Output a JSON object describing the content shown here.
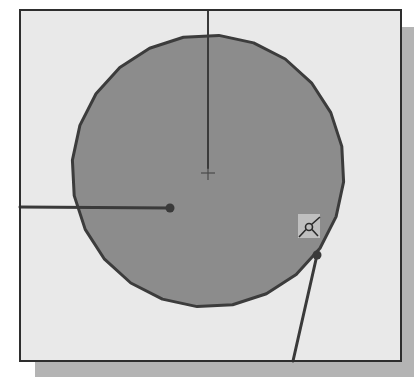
{
  "figure": {
    "colors": {
      "page_background": "#ffffff",
      "viewport_background": "#e9e9e9",
      "viewport_border": "#2e2e2e",
      "shadow": "#b4b4b4",
      "circle_fill": "#8c8c8c",
      "circle_outline": "#3c3c3c",
      "leader_line": "#3a3a3a",
      "snap_box": "#c8c8c8",
      "snap_glyph": "#2a2a2a"
    },
    "viewport": {
      "x": 20,
      "y": 10,
      "width": 381,
      "height": 351
    },
    "shadow": {
      "x": 35,
      "y": 27,
      "width": 379,
      "height": 350
    },
    "circle": {
      "cx": 208,
      "cy": 171,
      "r": 136,
      "segments": 24
    },
    "center_mark": {
      "x": 208,
      "y": 173,
      "size": 7
    },
    "leaders": [
      {
        "name": "vertical-leader",
        "x1": 208,
        "y1": 10,
        "x2": 208,
        "y2": 168,
        "dot": false
      },
      {
        "name": "horizontal-leader",
        "x1": 20,
        "y1": 207,
        "x2": 170,
        "y2": 208,
        "dot": true
      },
      {
        "name": "diagonal-leader",
        "x1": 293,
        "y1": 361,
        "x2": 317,
        "y2": 255,
        "dot": true
      }
    ],
    "snap_marker": {
      "type": "tangent-snap-icon",
      "box": {
        "x": 298,
        "y": 214,
        "width": 22,
        "height": 24
      },
      "circle": {
        "cx": 309,
        "cy": 227,
        "r": 3.5
      }
    }
  }
}
